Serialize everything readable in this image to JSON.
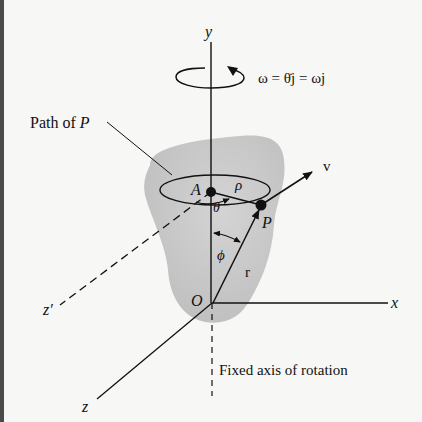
{
  "figure": {
    "background_color": "#f7f7f5",
    "body_color": "#c9c9c9",
    "line_color": "#111111"
  },
  "labels": {
    "y_axis": "y",
    "x_axis": "x",
    "z_axis": "z",
    "z_prime_axis": "z′",
    "origin": "O",
    "point_A": "A",
    "point_P": "P",
    "rho": "ρ",
    "theta": "θ",
    "phi": "ϕ",
    "r_vector": "r",
    "v_vector": "v",
    "path_label": "Path of ",
    "path_label_point": "P",
    "omega_equation": "ω = θ̇j = ωj",
    "fixed_axis_label": "Fixed axis of rotation"
  },
  "icons": {
    "rotation_arrow": "circular-rotation-arrow-icon"
  }
}
